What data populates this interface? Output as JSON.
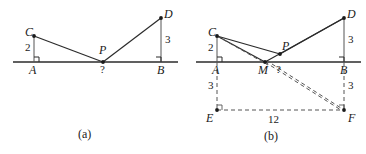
{
  "figure": {
    "type": "geometry-diagram",
    "panels": [
      {
        "id": "a",
        "caption": "(a)",
        "points": [
          {
            "name": "A",
            "label": "A"
          },
          {
            "name": "B",
            "label": "B"
          },
          {
            "name": "C",
            "label": "C"
          },
          {
            "name": "D",
            "label": "D"
          },
          {
            "name": "P",
            "label": "P"
          }
        ],
        "measures": [
          {
            "name": "CA",
            "label": "2"
          },
          {
            "name": "DB",
            "label": "3"
          },
          {
            "name": "CP-plus-PD",
            "label": "?"
          }
        ]
      },
      {
        "id": "b",
        "caption": "(b)",
        "points": [
          {
            "name": "A",
            "label": "A"
          },
          {
            "name": "B",
            "label": "B"
          },
          {
            "name": "C",
            "label": "C"
          },
          {
            "name": "D",
            "label": "D"
          },
          {
            "name": "P",
            "label": "P"
          },
          {
            "name": "M",
            "label": "M"
          },
          {
            "name": "E",
            "label": "E"
          },
          {
            "name": "F",
            "label": "F"
          }
        ],
        "measures": [
          {
            "name": "CA",
            "label": "2"
          },
          {
            "name": "DB",
            "label": "3"
          },
          {
            "name": "AE",
            "label": "3"
          },
          {
            "name": "BF",
            "label": "3"
          },
          {
            "name": "EF",
            "label": "12"
          },
          {
            "name": "MP",
            "label": "?"
          }
        ]
      }
    ],
    "colors": {
      "stroke": "#2b2b2b",
      "dashed": "#555555",
      "background": "#ffffff"
    }
  }
}
